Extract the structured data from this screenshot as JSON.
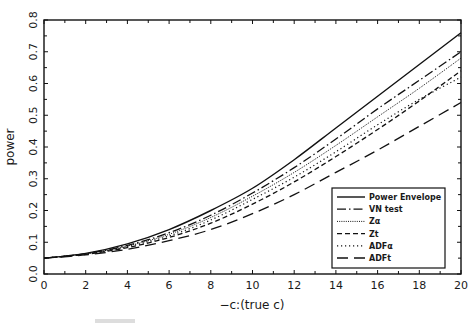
{
  "chart_data": {
    "type": "line",
    "title": "",
    "xlabel": "−c:(true c)",
    "ylabel": "power",
    "xlim": [
      0,
      20
    ],
    "ylim": [
      0.0,
      0.8
    ],
    "xticks": [
      0,
      2,
      4,
      6,
      8,
      10,
      12,
      14,
      16,
      18,
      20
    ],
    "xtick_labels": [
      "0",
      "2",
      "4",
      "6",
      "8",
      "10",
      "12",
      "14",
      "16",
      "18",
      "20"
    ],
    "yticks": [
      0.0,
      0.1,
      0.2,
      0.3,
      0.4,
      0.5,
      0.6,
      0.7,
      0.8
    ],
    "ytick_labels": [
      "0.0",
      "0.1",
      "0.2",
      "0.3",
      "0.4",
      "0.5",
      "0.6",
      "0.7",
      "0.8"
    ],
    "grid": false,
    "legend_position": "lower right",
    "x": [
      0,
      2,
      4,
      6,
      8,
      10,
      12,
      14,
      16,
      18,
      20
    ],
    "series": [
      {
        "name": "Power Envelope",
        "style": "solid",
        "values": [
          0.05,
          0.065,
          0.095,
          0.14,
          0.2,
          0.27,
          0.36,
          0.46,
          0.56,
          0.66,
          0.76
        ]
      },
      {
        "name": "VN test",
        "style": "dash-dot",
        "values": [
          0.05,
          0.064,
          0.09,
          0.13,
          0.185,
          0.255,
          0.335,
          0.425,
          0.52,
          0.61,
          0.7
        ]
      },
      {
        "name": "Zα",
        "style": "dense-dotted",
        "values": [
          0.05,
          0.063,
          0.088,
          0.125,
          0.178,
          0.245,
          0.32,
          0.405,
          0.495,
          0.585,
          0.68
        ]
      },
      {
        "name": "Zt",
        "style": "dashed",
        "values": [
          0.05,
          0.062,
          0.083,
          0.115,
          0.16,
          0.22,
          0.29,
          0.37,
          0.455,
          0.545,
          0.64
        ]
      },
      {
        "name": "ADFα",
        "style": "sparse-dotted",
        "values": [
          0.05,
          0.063,
          0.086,
          0.12,
          0.17,
          0.235,
          0.305,
          0.385,
          0.47,
          0.55,
          0.62
        ]
      },
      {
        "name": "ADFt",
        "style": "long-dashed",
        "values": [
          0.05,
          0.06,
          0.078,
          0.105,
          0.14,
          0.19,
          0.25,
          0.32,
          0.39,
          0.465,
          0.54
        ]
      }
    ]
  },
  "legend": {
    "items": [
      {
        "label": "Power Envelope"
      },
      {
        "label": "VN test"
      },
      {
        "label": "Zα"
      },
      {
        "label": "Zt"
      },
      {
        "label": "ADFα"
      },
      {
        "label": "ADFt"
      }
    ]
  }
}
